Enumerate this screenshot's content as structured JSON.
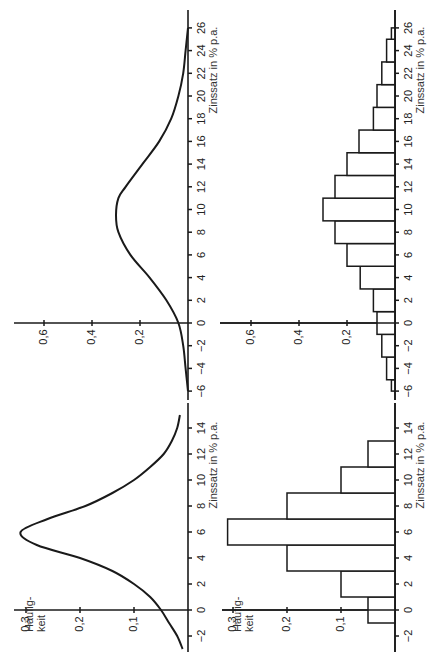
{
  "orientation": "rotated 90 degrees counter-clockwise",
  "chart_data": [
    {
      "id": "top-left",
      "type": "line",
      "title": "",
      "xlabel": "Zinssatz in % p.a.",
      "ylabel": "",
      "xlim": [
        -6,
        26
      ],
      "ylim": [
        0,
        0.7
      ],
      "x_ticks": [
        -6,
        -4,
        -2,
        0,
        2,
        4,
        6,
        8,
        10,
        12,
        14,
        16,
        18,
        20,
        22,
        24,
        26
      ],
      "y_ticks": [
        "0,2",
        "0,4",
        "0,6"
      ],
      "x": [
        -6,
        -4,
        -2,
        0,
        2,
        4,
        6,
        8,
        9.5,
        11,
        12,
        14,
        16,
        18,
        20,
        22,
        24,
        26
      ],
      "y": [
        0.0,
        0.01,
        0.02,
        0.04,
        0.09,
        0.16,
        0.24,
        0.29,
        0.3,
        0.29,
        0.26,
        0.19,
        0.12,
        0.07,
        0.04,
        0.02,
        0.01,
        0.0
      ]
    },
    {
      "id": "bottom-left",
      "type": "line",
      "title": "",
      "xlabel": "Zinssatz in % p.a.",
      "ylabel": "Häufig-keit",
      "xlim": [
        -3,
        15
      ],
      "ylim": [
        0,
        0.32
      ],
      "x_ticks": [
        -2,
        0,
        2,
        4,
        6,
        8,
        10,
        12,
        14
      ],
      "y_ticks": [
        "0,1",
        "0,2",
        "0,3"
      ],
      "x": [
        -3,
        -2,
        -1,
        0,
        1,
        2,
        3,
        4,
        5,
        6,
        7,
        8,
        9,
        10,
        11,
        12,
        13,
        14,
        15
      ],
      "y": [
        0.01,
        0.02,
        0.035,
        0.05,
        0.07,
        0.1,
        0.14,
        0.2,
        0.28,
        0.31,
        0.26,
        0.19,
        0.14,
        0.1,
        0.07,
        0.045,
        0.03,
        0.02,
        0.015
      ]
    },
    {
      "id": "top-right",
      "type": "bar",
      "title": "",
      "xlabel": "Zinssatz in % p.a.",
      "ylabel": "",
      "xlim": [
        -6,
        26
      ],
      "ylim": [
        0,
        0.7
      ],
      "x_ticks": [
        -6,
        -4,
        -2,
        0,
        2,
        4,
        6,
        8,
        10,
        12,
        14,
        16,
        18,
        20,
        22,
        24,
        26
      ],
      "y_ticks": [
        "0,2",
        "0,4",
        "0,6"
      ],
      "bins": [
        [
          -6,
          -5
        ],
        [
          -5,
          -3
        ],
        [
          -3,
          -1
        ],
        [
          -1,
          1
        ],
        [
          1,
          3
        ],
        [
          3,
          5
        ],
        [
          5,
          7
        ],
        [
          7,
          9
        ],
        [
          9,
          11
        ],
        [
          11,
          13
        ],
        [
          13,
          15
        ],
        [
          15,
          17
        ],
        [
          17,
          19
        ],
        [
          19,
          21
        ],
        [
          21,
          23
        ],
        [
          23,
          25
        ],
        [
          25,
          26
        ]
      ],
      "values": [
        0.015,
        0.035,
        0.055,
        0.075,
        0.09,
        0.145,
        0.2,
        0.25,
        0.3,
        0.25,
        0.2,
        0.15,
        0.09,
        0.075,
        0.055,
        0.035,
        0.015
      ]
    },
    {
      "id": "bottom-right",
      "type": "bar",
      "title": "",
      "xlabel": "Zinssatz in % p.a.",
      "ylabel": "Häufig-keit",
      "xlim": [
        -3,
        15
      ],
      "ylim": [
        0,
        0.32
      ],
      "x_ticks": [
        -2,
        0,
        2,
        4,
        6,
        8,
        10,
        12,
        14
      ],
      "y_ticks": [
        "0,1",
        "0,2",
        "0,3"
      ],
      "bins": [
        [
          -1,
          1
        ],
        [
          1,
          3
        ],
        [
          3,
          5
        ],
        [
          5,
          7
        ],
        [
          7,
          9
        ],
        [
          9,
          11
        ],
        [
          11,
          13
        ]
      ],
      "values": [
        0.05,
        0.1,
        0.2,
        0.31,
        0.2,
        0.1,
        0.05
      ]
    }
  ],
  "labels": {
    "xlabel": "Zinssatz in % p.a.",
    "ylabel_line1": "Häufig-",
    "ylabel_line2": "keit"
  }
}
